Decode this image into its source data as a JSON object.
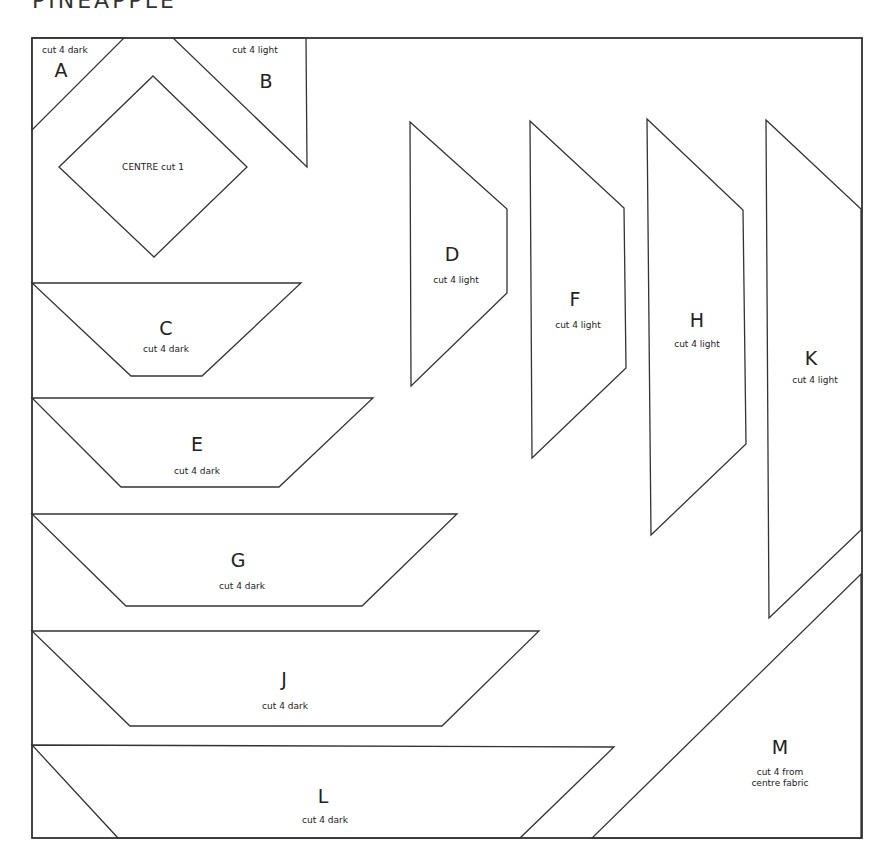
{
  "title": "PINEAPPLE",
  "pieces": {
    "A": {
      "letter": "A",
      "note": "cut 4 dark"
    },
    "B": {
      "letter": "B",
      "note": "cut 4 light"
    },
    "centre": {
      "letter": "",
      "note": "CENTRE cut 1"
    },
    "C": {
      "letter": "C",
      "note": "cut 4 dark"
    },
    "D": {
      "letter": "D",
      "note": "cut 4 light"
    },
    "E": {
      "letter": "E",
      "note": "cut 4 dark"
    },
    "F": {
      "letter": "F",
      "note": "cut 4 light"
    },
    "G": {
      "letter": "G",
      "note": "cut 4 dark"
    },
    "H": {
      "letter": "H",
      "note": "cut 4 light"
    },
    "J": {
      "letter": "J",
      "note": "cut 4 dark"
    },
    "K": {
      "letter": "K",
      "note": "cut 4 light"
    },
    "L": {
      "letter": "L",
      "note": "cut 4 dark"
    },
    "M": {
      "letter": "M",
      "note_line1": "cut 4 from",
      "note_line2": "centre fabric"
    }
  },
  "colors": {
    "line": "#333333",
    "background": "#ffffff"
  }
}
